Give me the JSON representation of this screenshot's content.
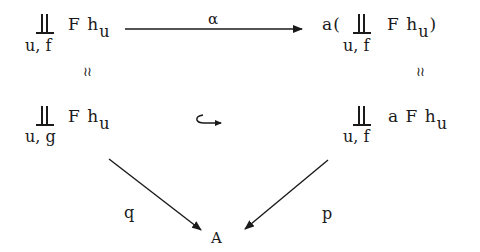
{
  "diagram": {
    "type": "commutative-diagram",
    "nodes": {
      "top_left": {
        "coproduct_symbol": "∐",
        "index": "u, f",
        "expr_main": "F h",
        "expr_sub": "u"
      },
      "top_right": {
        "prefix": "a(",
        "coproduct_symbol": "∐",
        "index": "u, f",
        "expr_main": "F h",
        "expr_sub": "u",
        "suffix": ")"
      },
      "mid_left": {
        "coproduct_symbol": "∐",
        "index": "u, g",
        "expr_main": "F h",
        "expr_sub": "u"
      },
      "mid_right": {
        "coproduct_symbol": "∐",
        "index": "u, f",
        "expr_main": "a F h",
        "expr_sub": "u"
      },
      "bottom": {
        "label": "A"
      }
    },
    "morphisms": {
      "top": {
        "label": "α",
        "from": "top_left",
        "to": "top_right",
        "style": "arrow"
      },
      "left_vertical": {
        "label": "≀≀",
        "meaning": "isomorphism",
        "from": "top_left",
        "to": "mid_left"
      },
      "right_vertical": {
        "label": "≀≀",
        "meaning": "isomorphism",
        "from": "top_right",
        "to": "mid_right"
      },
      "middle": {
        "label": "↪",
        "meaning": "inclusion",
        "from": "mid_left",
        "to": "mid_right"
      },
      "q": {
        "label": "q",
        "from": "mid_left",
        "to": "bottom",
        "style": "arrow"
      },
      "p": {
        "label": "p",
        "from": "mid_right",
        "to": "bottom",
        "style": "arrow"
      }
    },
    "colors": {
      "ink": "#1a1a1a",
      "background": "#ffffff"
    }
  }
}
